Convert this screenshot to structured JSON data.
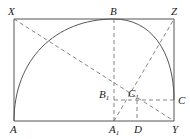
{
  "diagram": {
    "type": "geometric-construction",
    "stroke_color": "#555555",
    "points": {
      "X": {
        "label": "X",
        "x": 14,
        "y": 19
      },
      "B": {
        "label": "B",
        "x": 114,
        "y": 19
      },
      "Z": {
        "label": "Z",
        "x": 174,
        "y": 19
      },
      "A": {
        "label": "A",
        "x": 14,
        "y": 121
      },
      "A1": {
        "label": "A",
        "sub": "1",
        "x": 114,
        "y": 121
      },
      "D": {
        "label": "D",
        "x": 137,
        "y": 121
      },
      "Y": {
        "label": "Y",
        "x": 174,
        "y": 121
      },
      "B1": {
        "label": "B",
        "sub": "1",
        "x": 114,
        "y": 100
      },
      "C1": {
        "label": "C",
        "sub": "1",
        "x": 137,
        "y": 100
      },
      "C": {
        "label": "C",
        "x": 174,
        "y": 100
      }
    },
    "solid_segments": [
      "X-Z",
      "X-A",
      "A-Y",
      "Z-Y"
    ],
    "dashed_segments": [
      "X-Y",
      "B-A1",
      "B1-C",
      "C1-D",
      "A1-Z"
    ],
    "arcs": [
      "A-B-C"
    ]
  }
}
